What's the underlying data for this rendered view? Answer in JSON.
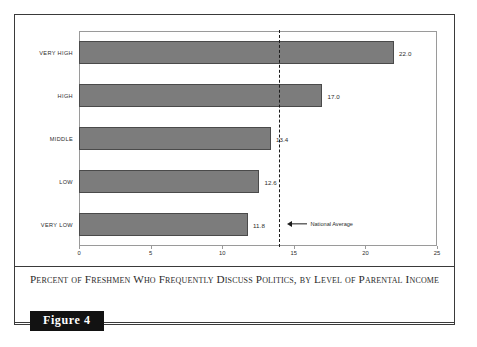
{
  "figure": {
    "badge_label": "Figure 4",
    "caption": "Percent of Freshmen Who Frequently Discuss Politics, by Level of Parental Income"
  },
  "annotations": {
    "national_average_label": "National Average"
  },
  "colors": {
    "bar_fill": "#7c7c7c",
    "bar_border": "#4a4a4a",
    "axis": "#9a9a9a",
    "frame": "#3a3a3a",
    "text": "#2c2c2c",
    "reference_line": "#1b1b1b",
    "badge_background": "#121212",
    "badge_text": "#ffffff"
  },
  "chart_data": {
    "type": "bar",
    "orientation": "horizontal",
    "title": "Percent of Freshmen Who Frequently Discuss Politics, by Level of Parental Income",
    "xlabel": "",
    "ylabel": "",
    "categories": [
      "Very High",
      "High",
      "Middle",
      "Low",
      "Very Low"
    ],
    "values": [
      22.0,
      17.0,
      13.4,
      12.6,
      11.8
    ],
    "value_labels": [
      "22.0",
      "17.0",
      "13.4",
      "12.6",
      "11.8"
    ],
    "xlim": [
      0,
      25
    ],
    "xticks": [
      0,
      5,
      10,
      15,
      20,
      25
    ],
    "xtick_labels": [
      "0",
      "5",
      "10",
      "15",
      "20",
      "25"
    ],
    "grid": false,
    "legend": null,
    "reference_line": {
      "value": 14.0,
      "label": "National Average",
      "style": "dashed",
      "orientation": "vertical"
    }
  }
}
